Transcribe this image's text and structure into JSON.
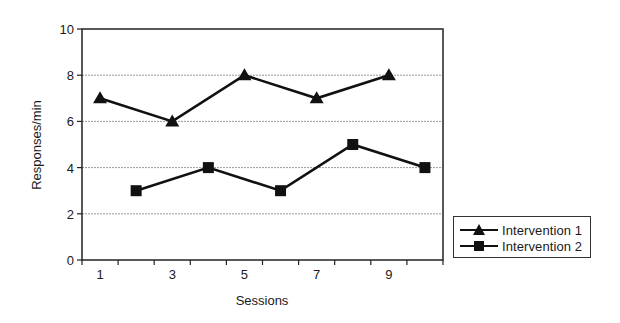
{
  "chart_data": {
    "type": "line",
    "title": "",
    "xlabel": "Sessions",
    "ylabel": "Responses/min",
    "ylim": [
      0,
      10
    ],
    "yticks": [
      0,
      2,
      4,
      6,
      8,
      10
    ],
    "xticks_labeled": [
      1,
      3,
      5,
      7,
      9
    ],
    "x_categories": [
      1,
      2,
      3,
      4,
      5,
      6,
      7,
      8,
      9,
      10
    ],
    "grid": true,
    "legend_position": "right",
    "series": [
      {
        "name": "Intervention 1",
        "marker": "triangle",
        "x": [
          1,
          3,
          5,
          7,
          9
        ],
        "values": [
          7,
          6,
          8,
          7,
          8
        ]
      },
      {
        "name": "Intervention 2",
        "marker": "square",
        "x": [
          2,
          4,
          6,
          8,
          10
        ],
        "values": [
          3,
          4,
          3,
          5,
          4
        ]
      }
    ]
  },
  "legend": {
    "items": [
      {
        "label": "Intervention 1",
        "marker": "triangle"
      },
      {
        "label": "Intervention 2",
        "marker": "square"
      }
    ]
  },
  "colors": {
    "line": "#111111",
    "grid": "#9a9a9a",
    "axis": "#222222"
  }
}
